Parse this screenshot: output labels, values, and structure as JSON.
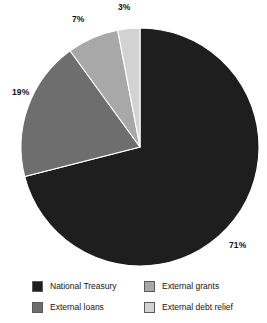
{
  "chart_data": {
    "type": "pie",
    "title": "",
    "subtitle": "",
    "xlabel": "",
    "ylabel": "",
    "grid": false,
    "legend_position": "bottom",
    "start_angle_deg": 0,
    "direction": "clockwise",
    "units": "percent",
    "total": 100,
    "categories": [
      "National Treasury",
      "External loans",
      "External grants",
      "External debt relief"
    ],
    "values": [
      71,
      19,
      7,
      3
    ],
    "labels": [
      "71%",
      "19%",
      "7%",
      "3%"
    ],
    "colors": [
      "#1e1e1e",
      "#6e6e6e",
      "#a8a8a8",
      "#d2d2d2"
    ],
    "slices": [
      {
        "name": "National Treasury",
        "value": 71,
        "label": "71%",
        "color": "#1e1e1e",
        "start_deg": 0,
        "end_deg": 255.6
      },
      {
        "name": "External loans",
        "value": 19,
        "label": "19%",
        "color": "#6e6e6e",
        "start_deg": 255.6,
        "end_deg": 324.0
      },
      {
        "name": "External grants",
        "value": 7,
        "label": "7%",
        "color": "#a8a8a8",
        "start_deg": 324.0,
        "end_deg": 349.2
      },
      {
        "name": "External debt relief",
        "value": 3,
        "label": "3%",
        "color": "#d2d2d2",
        "start_deg": 349.2,
        "end_deg": 360.0
      }
    ]
  },
  "legend": {
    "items": [
      {
        "label": "National Treasury",
        "color": "#1e1e1e"
      },
      {
        "label": "External grants",
        "color": "#a8a8a8"
      },
      {
        "label": "External loans",
        "color": "#6e6e6e"
      },
      {
        "label": "External debt relief",
        "color": "#d2d2d2"
      }
    ]
  }
}
